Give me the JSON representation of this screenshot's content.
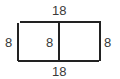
{
  "diagram": {
    "type": "rectangle-divided",
    "stroke_color": "#222222",
    "label_color": "#3a3a3a",
    "labels": {
      "top": "18",
      "bottom": "18",
      "left": "8",
      "middle": "8",
      "right": "8"
    }
  }
}
